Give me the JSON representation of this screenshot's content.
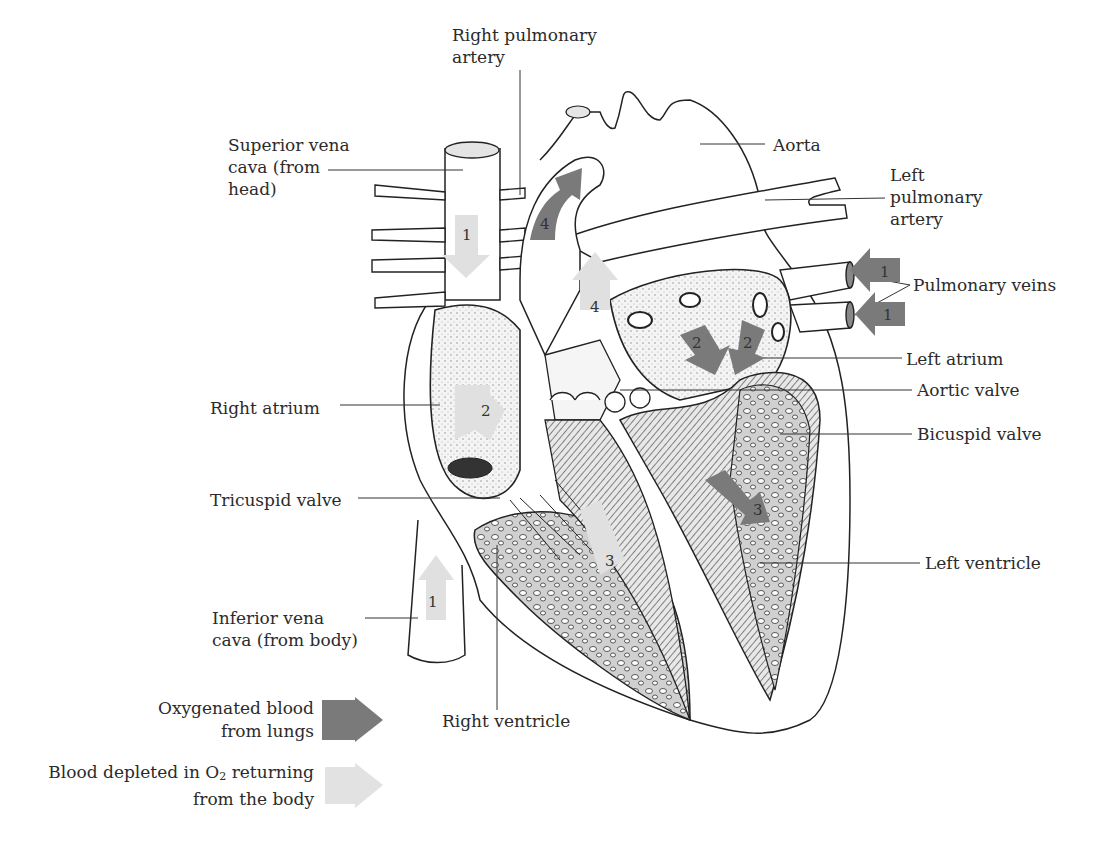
{
  "diagram": {
    "labels": {
      "right_pulmonary_artery": "Right pulmonary\nartery",
      "right_pulmonary_artery_l1": "Right pulmonary",
      "right_pulmonary_artery_l2": "artery",
      "superior_vena_cava_l1": "Superior vena",
      "superior_vena_cava_l2": "cava (from",
      "superior_vena_cava_l3": "head)",
      "aorta": "Aorta",
      "left_pulmonary_artery_l1": "Left",
      "left_pulmonary_artery_l2": "pulmonary",
      "left_pulmonary_artery_l3": "artery",
      "pulmonary_veins": "Pulmonary veins",
      "left_atrium": "Left atrium",
      "aortic_valve": "Aortic valve",
      "bicuspid_valve": "Bicuspid valve",
      "right_atrium": "Right atrium",
      "tricuspid_valve": "Tricuspid valve",
      "left_ventricle": "Left ventricle",
      "inferior_vena_cava_l1": "Inferior vena",
      "inferior_vena_cava_l2": "cava (from body)",
      "right_ventricle": "Right ventricle"
    },
    "flow_steps": {
      "svc": "1",
      "ivc": "1",
      "pv_top": "1",
      "pv_bottom": "1",
      "ra": "2",
      "la_left": "2",
      "la_right": "2",
      "rv": "3",
      "lv": "3",
      "pa_upper": "4",
      "pa_lower": "4"
    },
    "legend": [
      {
        "line1": "Oxygenated blood",
        "line2": "from lungs",
        "color": "#7a7a7a"
      },
      {
        "line1_pre": "Blood depleted in O",
        "line1_sub": "2",
        "line1_post": " returning",
        "line2": "from the body",
        "color": "#e2e2e2"
      }
    ],
    "colors": {
      "oxygenated": "#7a7a7a",
      "deoxygenated": "#e0e0e0",
      "outline": "#222222",
      "tissue": "#c8c8c8"
    }
  }
}
